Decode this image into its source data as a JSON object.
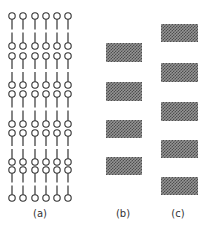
{
  "figure": {
    "panels": [
      {
        "id": "a",
        "label": "(a)",
        "type": "lipid-bilayer-stack",
        "bilayer_count": 5,
        "columns": 6
      },
      {
        "id": "b",
        "label": "(b)",
        "type": "block-stack",
        "block_count": 4
      },
      {
        "id": "c",
        "label": "(c)",
        "type": "block-stack",
        "block_count": 5
      }
    ],
    "colors": {
      "line": "#333333",
      "block_dark": "#3a3a3a",
      "block_light": "#8a8a8a",
      "background": "#ffffff"
    }
  }
}
